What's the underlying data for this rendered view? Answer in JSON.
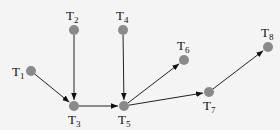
{
  "diagram": {
    "type": "directed-graph",
    "colors": {
      "background": "#f4f4f4",
      "node": "#8a8a8a",
      "edge": "#222222"
    },
    "nodes": [
      {
        "id": "T1",
        "label": "T",
        "sub": "1",
        "x": 31,
        "y": 71,
        "lx": 12,
        "ly": 76
      },
      {
        "id": "T2",
        "label": "T",
        "sub": "2",
        "x": 74,
        "y": 30,
        "lx": 66,
        "ly": 20
      },
      {
        "id": "T3",
        "label": "T",
        "sub": "3",
        "x": 74,
        "y": 106,
        "lx": 68,
        "ly": 124
      },
      {
        "id": "T4",
        "label": "T",
        "sub": "4",
        "x": 123,
        "y": 30,
        "lx": 116,
        "ly": 20
      },
      {
        "id": "T5",
        "label": "T",
        "sub": "5",
        "x": 124,
        "y": 106,
        "lx": 118,
        "ly": 124
      },
      {
        "id": "T6",
        "label": "T",
        "sub": "6",
        "x": 184,
        "y": 60,
        "lx": 177,
        "ly": 50
      },
      {
        "id": "T7",
        "label": "T",
        "sub": "7",
        "x": 209,
        "y": 92,
        "lx": 203,
        "ly": 110
      },
      {
        "id": "T8",
        "label": "T",
        "sub": "8",
        "x": 268,
        "y": 47,
        "lx": 261,
        "ly": 37
      }
    ],
    "edges": [
      {
        "from": "T1",
        "to": "T3"
      },
      {
        "from": "T2",
        "to": "T3"
      },
      {
        "from": "T3",
        "to": "T5"
      },
      {
        "from": "T4",
        "to": "T5"
      },
      {
        "from": "T5",
        "to": "T6"
      },
      {
        "from": "T5",
        "to": "T7"
      },
      {
        "from": "T7",
        "to": "T8"
      }
    ]
  }
}
